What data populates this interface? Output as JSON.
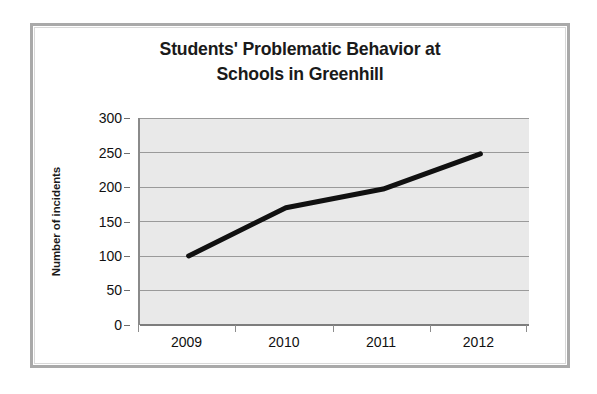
{
  "chart_data": {
    "type": "line",
    "title": "Students' Problematic Behavior at Schools in Greenhill",
    "title_lines": [
      "Students' Problematic Behavior at",
      "Schools in Greenhill"
    ],
    "xlabel": "",
    "ylabel": "Number of incidents",
    "categories": [
      "2009",
      "2010",
      "2011",
      "2012"
    ],
    "values": [
      100,
      170,
      197,
      248
    ],
    "series": [
      {
        "name": "Number of incidents",
        "values": [
          100,
          170,
          197,
          248
        ]
      }
    ],
    "ylim": [
      0,
      300
    ],
    "y_ticks": [
      0,
      50,
      100,
      150,
      200,
      250,
      300
    ],
    "y_tick_labels": [
      "0",
      "50",
      "100",
      "150",
      "200",
      "250",
      "300"
    ],
    "grid": "horizontal",
    "legend": "none",
    "annotations": [],
    "style": {
      "line_color": "#111111",
      "line_width": 5,
      "plot_background": "#e9e9e9",
      "gridline_color": "#9a9a9a",
      "frame_color": "#a9a9a9",
      "text_color": "#111111",
      "page_background": "#ffffff"
    }
  }
}
